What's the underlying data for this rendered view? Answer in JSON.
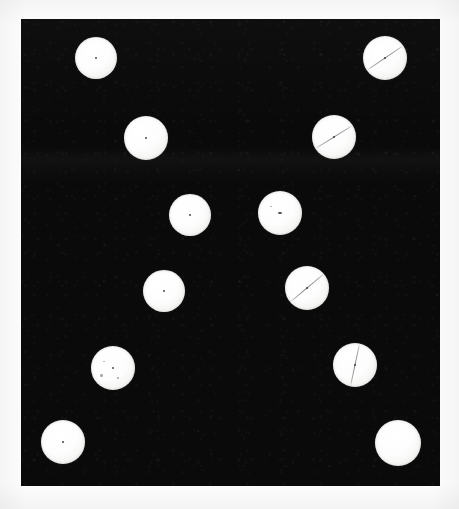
{
  "image": {
    "title": "Tablet specimen photograph",
    "caption": "Twelve round white tablets arranged on a black background board",
    "subject_count": 12,
    "background_color": "#0a0a0b",
    "page_color": "#ffffff",
    "subject_color": "#fdfdfd"
  },
  "panel": {
    "x": 21,
    "y": 19,
    "width": 419,
    "height": 467,
    "color": "#0a0a0b",
    "label": "dark background board"
  },
  "chart_data": {
    "type": "scatter",
    "xlabel": "",
    "ylabel": "",
    "xlim": [
      21,
      440
    ],
    "ylim": [
      19,
      486
    ],
    "grid": false,
    "legend": "none",
    "categories": [
      "plain",
      "scored"
    ],
    "series": [
      {
        "name": "tablets",
        "points": [
          {
            "id": 1,
            "x": 96,
            "y": 58,
            "r": 21,
            "score": false,
            "score_angle": 0,
            "mark": true,
            "mark_size": 2.0,
            "specks": 0
          },
          {
            "id": 2,
            "x": 385,
            "y": 58,
            "r": 22,
            "score": true,
            "score_angle": -34,
            "mark": true,
            "mark_size": 2.6,
            "specks": 0
          },
          {
            "id": 3,
            "x": 146,
            "y": 138,
            "r": 22,
            "score": false,
            "score_angle": 0,
            "mark": true,
            "mark_size": 1.8,
            "specks": 0
          },
          {
            "id": 4,
            "x": 334,
            "y": 137,
            "r": 22,
            "score": true,
            "score_angle": -32,
            "mark": true,
            "mark_size": 2.8,
            "specks": 0
          },
          {
            "id": 5,
            "x": 190,
            "y": 215,
            "r": 21,
            "score": false,
            "score_angle": 0,
            "mark": true,
            "mark_size": 2.0,
            "specks": 0
          },
          {
            "id": 6,
            "x": 280,
            "y": 213,
            "r": 22,
            "score": false,
            "score_angle": 0,
            "mark": true,
            "mark_size": 3.4,
            "specks": 1
          },
          {
            "id": 7,
            "x": 164,
            "y": 291,
            "r": 21,
            "score": false,
            "score_angle": 0,
            "mark": true,
            "mark_size": 2.4,
            "specks": 0
          },
          {
            "id": 8,
            "x": 307,
            "y": 288,
            "r": 22,
            "score": true,
            "score_angle": -40,
            "mark": true,
            "mark_size": 2.2,
            "specks": 0
          },
          {
            "id": 9,
            "x": 113,
            "y": 368,
            "r": 22,
            "score": false,
            "score_angle": 0,
            "mark": true,
            "mark_size": 2.6,
            "specks": 3
          },
          {
            "id": 10,
            "x": 355,
            "y": 365,
            "r": 22,
            "score": true,
            "score_angle": -78,
            "mark": true,
            "mark_size": 2.0,
            "specks": 0
          },
          {
            "id": 11,
            "x": 63,
            "y": 442,
            "r": 22,
            "score": false,
            "score_angle": 0,
            "mark": true,
            "mark_size": 1.6,
            "specks": 0
          },
          {
            "id": 12,
            "x": 398,
            "y": 443,
            "r": 23,
            "score": false,
            "score_angle": 0,
            "mark": false,
            "mark_size": 0,
            "specks": 0
          }
        ]
      }
    ],
    "counts": {
      "total": 12,
      "scored": 4,
      "plain": 8
    }
  }
}
